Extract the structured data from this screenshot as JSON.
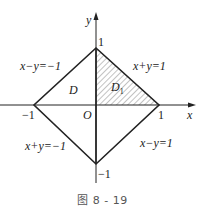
{
  "figure": {
    "caption": "图 8 - 19",
    "axes": {
      "x_label": "x",
      "y_label": "y",
      "origin_label": "O"
    },
    "ticks": {
      "x_pos": "1",
      "x_neg": "−1",
      "y_pos": "1",
      "y_neg": "−1"
    },
    "edges": {
      "upper_left": "x−y=−1",
      "upper_right": "x+y=1",
      "lower_left": "x+y=−1",
      "lower_right": "x−y=1"
    },
    "regions": {
      "whole": "D",
      "shaded": "D",
      "shaded_subscript": "1"
    },
    "colors": {
      "line": "#222222",
      "hatch": "#555555",
      "background": "#ffffff"
    }
  }
}
